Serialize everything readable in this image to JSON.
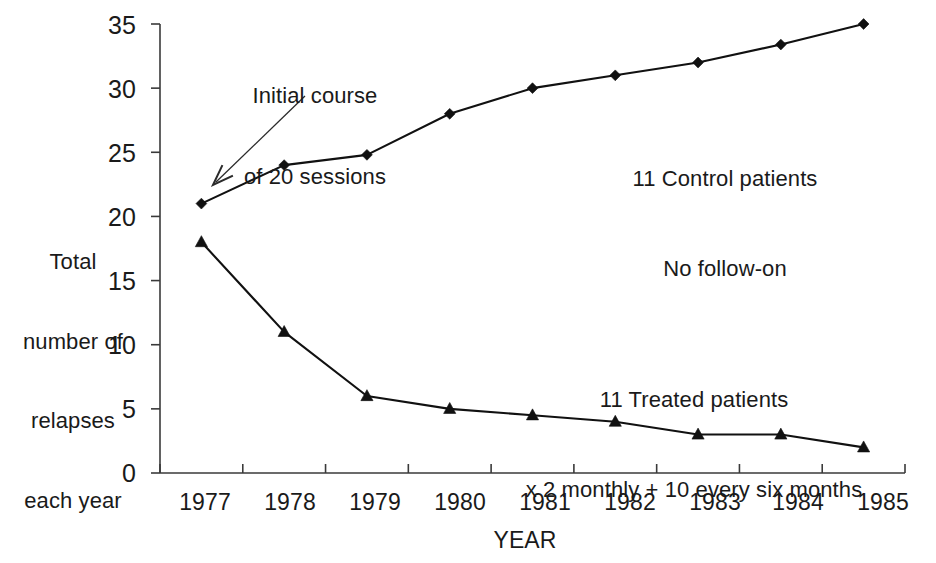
{
  "chart_data": {
    "type": "line",
    "title": "",
    "xlabel": "YEAR",
    "ylabel": "Total number of relapses each year",
    "ylabel_lines": [
      "Total",
      "number of",
      "relapses",
      "each year"
    ],
    "categories": [
      "1977",
      "1978",
      "1979",
      "1980",
      "1981",
      "1982",
      "1983",
      "1984",
      "1985"
    ],
    "x": [
      1977,
      1978,
      1979,
      1980,
      1981,
      1982,
      1983,
      1984,
      1985
    ],
    "ylim": [
      0,
      35
    ],
    "yticks": [
      0,
      5,
      10,
      15,
      20,
      25,
      30,
      35
    ],
    "ytick_labels": [
      "0",
      "5",
      "10",
      "15",
      "20",
      "25",
      "30",
      "35"
    ],
    "grid": false,
    "legend_position": "inline-annotations",
    "series": [
      {
        "name": "11 Control patients",
        "marker": "diamond",
        "values": [
          21,
          24,
          24.8,
          28,
          30,
          31,
          32,
          33.4,
          35
        ]
      },
      {
        "name": "11 Treated patients",
        "marker": "triangle",
        "values": [
          18,
          11,
          6,
          5,
          4.5,
          4,
          3,
          3,
          2
        ]
      }
    ],
    "annotations": [
      {
        "id": "initial-course",
        "lines": [
          "Initial course",
          "of 20 sessions"
        ],
        "points_to_x": 1977,
        "points_to_y": 21
      },
      {
        "id": "control-label",
        "lines": [
          "11 Control patients",
          "No follow-on"
        ]
      },
      {
        "id": "treated-label",
        "lines": [
          "11 Treated patients",
          "x 2 monthly + 10 every six months"
        ]
      }
    ],
    "colors": {
      "line": "#111111",
      "marker": "#111111",
      "axis": "#3a3a3a",
      "text": "#1a1a1a",
      "background": "#ffffff"
    }
  },
  "labels": {
    "ytitle_l1": "Total",
    "ytitle_l2": "number of",
    "ytitle_l3": "relapses",
    "ytitle_l4": "each year",
    "xtitle": "YEAR",
    "annot_initial_l1": "Initial course",
    "annot_initial_l2": "of 20 sessions",
    "control_l1": "11 Control patients",
    "control_l2": "No follow-on",
    "treated_l1": "11 Treated patients",
    "treated_l2": "x 2 monthly + 10 every six months",
    "y0": "0",
    "y5": "5",
    "y10": "10",
    "y15": "15",
    "y20": "20",
    "y25": "25",
    "y30": "30",
    "y35": "35",
    "x1977": "1977",
    "x1978": "1978",
    "x1979": "1979",
    "x1980": "1980",
    "x1981": "1981",
    "x1982": "1982",
    "x1983": "1983",
    "x1984": "1984",
    "x1985": "1985"
  }
}
